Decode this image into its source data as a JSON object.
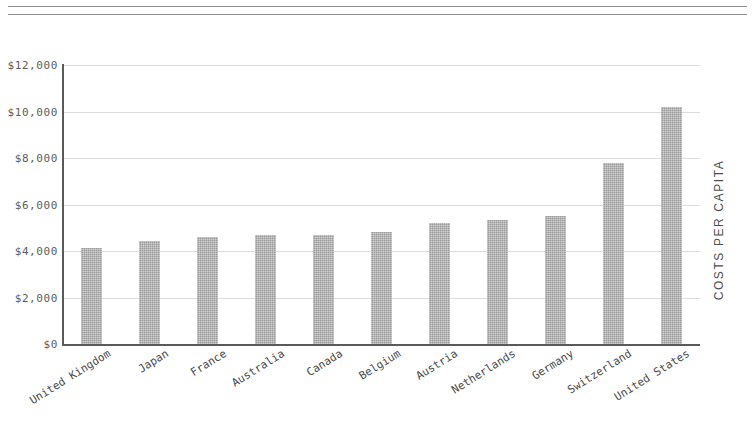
{
  "decor": {
    "top_rule_count": 2
  },
  "axis": {
    "y_title": "COSTS PER CAPITA",
    "y_ticks": [
      "$12,000",
      "$10,000",
      "$8,000",
      "$6,000",
      "$4,000",
      "$2,000",
      "$0"
    ]
  },
  "chart_data": {
    "type": "bar",
    "title": "",
    "subtitle": "",
    "xlabel": "",
    "ylabel": "COSTS PER CAPITA",
    "ylim": [
      0,
      12000
    ],
    "ytick_values": [
      0,
      2000,
      4000,
      6000,
      8000,
      10000,
      12000
    ],
    "ytick_labels": [
      "$0",
      "$2,000",
      "$4,000",
      "$6,000",
      "$8,000",
      "$10,000",
      "$12,000"
    ],
    "grid": "horizontal",
    "legend": "none",
    "bar_color": "#9a9a9a",
    "categories": [
      "United Kingdom",
      "Japan",
      "France",
      "Australia",
      "Canada",
      "Belgium",
      "Austria",
      "Netherlands",
      "Germany",
      "Switzerland",
      "United States"
    ],
    "values": [
      4150,
      4450,
      4600,
      4700,
      4700,
      4800,
      5200,
      5350,
      5500,
      7800,
      10200
    ]
  }
}
